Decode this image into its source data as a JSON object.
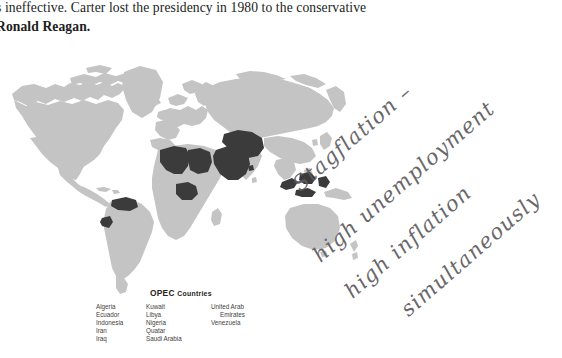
{
  "document": {
    "paragraph_line_1": "s ineffective. Carter lost the presidency in 1980 to the conservative",
    "paragraph_line_2": "Ronald Reagan."
  },
  "figure": {
    "name": "world-map-opec",
    "colors": {
      "land": "#c3c4c3",
      "opec_highlight": "#3c3b3c",
      "background": "#ffffff"
    },
    "highlighted_countries": [
      "Algeria",
      "Libya",
      "Nigeria",
      "Saudi Arabia",
      "Iran",
      "Iraq",
      "Kuwait",
      "Qatar",
      "United Arab Emirates",
      "Indonesia",
      "Venezuela",
      "Ecuador"
    ]
  },
  "legend": {
    "title_main": "OPEC",
    "title_rest": "Countries",
    "columns": [
      {
        "items": [
          "Algeria",
          "Ecuador",
          "Indonesia",
          "Iran",
          "Iraq"
        ]
      },
      {
        "items": [
          "Kuwait",
          "Libya",
          "Nigeria",
          "Quatar",
          "Saudi Arabia"
        ]
      },
      {
        "items": [
          "United Arab",
          "Emirates",
          "Venezuela"
        ]
      }
    ]
  },
  "annotations": {
    "ink_color": "#5d5a5e",
    "lines": [
      "Stagflation –",
      "high unemployment",
      "high inflation",
      "simultaneously"
    ]
  }
}
